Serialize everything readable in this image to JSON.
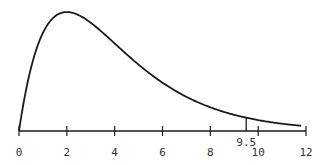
{
  "chart_data": {
    "type": "line",
    "title": "",
    "subtitle": "",
    "xlabel": "",
    "ylabel": "",
    "xlim": [
      0,
      12
    ],
    "grid": false,
    "legend": null,
    "x_ticks": [
      0,
      2,
      4,
      6,
      8,
      10,
      12
    ],
    "x_tick_labels": [
      "0",
      "2",
      "4",
      "6",
      "8",
      "10",
      "12"
    ],
    "annotations": [
      {
        "type": "vertical-line",
        "x": 9.5,
        "label": "9.5"
      }
    ],
    "series": [
      {
        "name": "density",
        "x": [
          0,
          0.5,
          1,
          1.5,
          2,
          2.5,
          3,
          3.5,
          4,
          5,
          6,
          7,
          8,
          9,
          9.5,
          10,
          11,
          11.8
        ],
        "y": [
          0,
          0.097,
          0.152,
          0.177,
          0.184,
          0.179,
          0.167,
          0.152,
          0.135,
          0.103,
          0.075,
          0.053,
          0.037,
          0.025,
          0.021,
          0.017,
          0.011,
          0.008
        ]
      }
    ]
  },
  "colors": {
    "line": "#1a1a1a",
    "text": "#333333",
    "background": "#ffffff"
  }
}
